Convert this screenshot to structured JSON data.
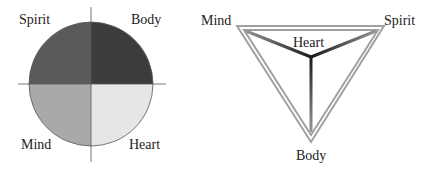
{
  "circle_diagram": {
    "quadrants": [
      {
        "label": "Spirit",
        "position": "top-left",
        "color": "#5a5a5a"
      },
      {
        "label": "Body",
        "position": "top-right",
        "color": "#3c3c3c"
      },
      {
        "label": "Mind",
        "position": "bottom-left",
        "color": "#a9a9a9"
      },
      {
        "label": "Heart",
        "position": "bottom-right",
        "color": "#e6e6e6"
      }
    ]
  },
  "triangle_diagram": {
    "vertices": [
      {
        "label": "Mind",
        "position": "top-left"
      },
      {
        "label": "Spirit",
        "position": "top-right"
      },
      {
        "label": "Body",
        "position": "bottom"
      }
    ],
    "center_label": "Heart"
  }
}
